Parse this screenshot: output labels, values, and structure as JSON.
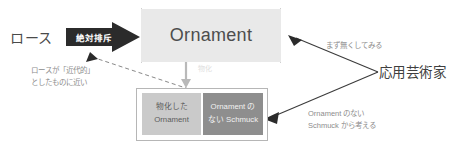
{
  "diagram": {
    "colors": {
      "ornament_box_fill": "#e9e9e9",
      "reified_box_fill": "#cacaca",
      "schmuck_box_fill": "#8e8e8e",
      "banner_fill": "#2b2b2b",
      "line": "#555555",
      "note_text": "#8d8d8d"
    }
  },
  "labels": {
    "loos": "ロース",
    "applied_artist": "応用芸術家"
  },
  "banner": {
    "absolute_rejection": "絶対排斥"
  },
  "boxes": {
    "ornament": {
      "label": "Ornament",
      "crossed_out": true
    },
    "reified_ornament": {
      "line1": "物化した",
      "line2": "Ornament",
      "crossed_out": true
    },
    "schmuck_without_ornament": {
      "line1": "Ornament の",
      "line2": "ない Schmuck"
    }
  },
  "notes": {
    "loos_modern": "ロースが「近代的」\nとしたものに近い",
    "try_removing": "まず無くしてみる",
    "think_from_schmuck": "Ornament のない\nSchmuck から考える",
    "reification": "物化"
  }
}
